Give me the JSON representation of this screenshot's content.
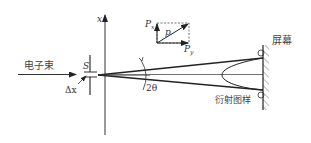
{
  "diagram": {
    "axis_label": "x",
    "beam_label": "电子束",
    "slit_label": "S",
    "slit_width_label": "Δx",
    "angle_label": "2θ",
    "screen_label": "屏幕",
    "pattern_label": "衍射图样",
    "vector": {
      "total": "p",
      "x_component": "Px",
      "x_component_base": "P",
      "x_component_sub": "x",
      "y_component_base": "P",
      "y_component_sub": "y"
    },
    "colors": {
      "line": "#222222",
      "background": "#ffffff"
    }
  }
}
